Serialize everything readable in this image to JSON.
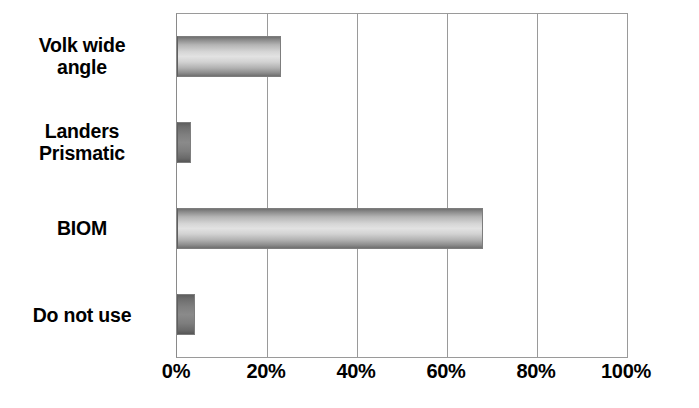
{
  "chart_data": {
    "type": "bar",
    "orientation": "horizontal",
    "title": "",
    "xlabel": "",
    "ylabel": "",
    "categories": [
      "Volk wide\nangle",
      "Landers\nPrismatic",
      "BIOM",
      "Do not use"
    ],
    "values": [
      23,
      3,
      68,
      4
    ],
    "value_suffix": "%",
    "xlim": [
      0,
      100
    ],
    "xticks": [
      0,
      20,
      40,
      60,
      80,
      100
    ],
    "xtick_labels": [
      "0%",
      "20%",
      "40%",
      "60%",
      "80%",
      "100%"
    ],
    "grid": "vertical",
    "legend": "none",
    "series": [
      {
        "name": "",
        "values": [
          23,
          3,
          68,
          4
        ]
      }
    ],
    "bar_style": "3d-cylinder-gray",
    "colors": {
      "bar_light": "#e2e2e2",
      "bar_mid": "#b0b0b0",
      "bar_dark": "#6f6f6f",
      "gridline": "#9a9a9a",
      "frame": "#9a9a9a",
      "text": "#000000",
      "background": "#ffffff"
    }
  }
}
